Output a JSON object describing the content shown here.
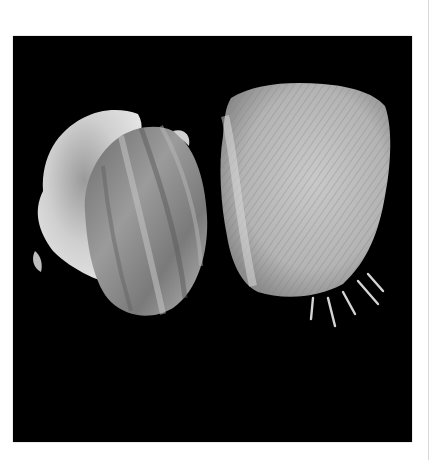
{
  "image": {
    "description": "Two bivalve shells photographed on a black background",
    "background_color": "#000000",
    "page_color": "#ffffff",
    "subjects": [
      {
        "name": "smooth-scallop-pair",
        "position": "left",
        "tones": [
          "#d9d9d9",
          "#8a8a8a",
          "#5a5a5a"
        ]
      },
      {
        "name": "spiny-scallop",
        "position": "right",
        "tones": [
          "#cfcfcf",
          "#a8a8a8",
          "#6e6e6e"
        ]
      }
    ]
  }
}
